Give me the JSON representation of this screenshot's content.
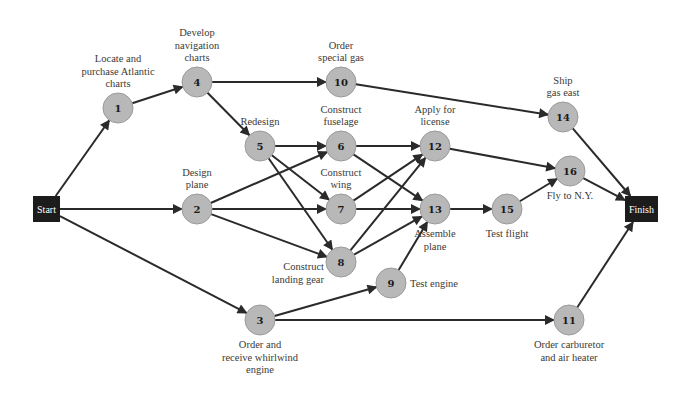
{
  "diagram": {
    "type": "network-diagram",
    "terminals": [
      {
        "id": "start",
        "label": "Start",
        "x": 33,
        "y": 196,
        "w": 27,
        "h": 26
      },
      {
        "id": "finish",
        "label": "Finish",
        "x": 625,
        "y": 196,
        "w": 33,
        "h": 26
      }
    ],
    "nodes": [
      {
        "id": "1",
        "number": "1",
        "x": 118,
        "y": 108,
        "label": [
          "Locate and",
          "purchase Atlantic",
          "charts"
        ],
        "label_pos": "above"
      },
      {
        "id": "2",
        "number": "2",
        "x": 197,
        "y": 209,
        "label": [
          "Design",
          "plane"
        ],
        "label_pos": "above"
      },
      {
        "id": "3",
        "number": "3",
        "x": 260,
        "y": 320,
        "label": [
          "Order and",
          "receive whirlwind",
          "engine"
        ],
        "label_pos": "below"
      },
      {
        "id": "4",
        "number": "4",
        "x": 197,
        "y": 82,
        "label": [
          "Develop",
          "navigation",
          "charts"
        ],
        "label_pos": "above"
      },
      {
        "id": "5",
        "number": "5",
        "x": 260,
        "y": 146,
        "label": [
          "Redesign"
        ],
        "label_pos": "above"
      },
      {
        "id": "6",
        "number": "6",
        "x": 341,
        "y": 146,
        "label": [
          "Construct",
          "fuselage"
        ],
        "label_pos": "above"
      },
      {
        "id": "7",
        "number": "7",
        "x": 341,
        "y": 209,
        "label": [
          "Construct",
          "wing"
        ],
        "label_pos": "above"
      },
      {
        "id": "8",
        "number": "8",
        "x": 341,
        "y": 262,
        "label": [
          "Construct",
          "landing gear"
        ],
        "label_pos": "left-below"
      },
      {
        "id": "9",
        "number": "9",
        "x": 391,
        "y": 283,
        "label": [
          "Test engine"
        ],
        "label_pos": "right"
      },
      {
        "id": "10",
        "number": "10",
        "x": 341,
        "y": 82,
        "label": [
          "Order",
          "special gas"
        ],
        "label_pos": "above"
      },
      {
        "id": "11",
        "number": "11",
        "x": 569,
        "y": 320,
        "label": [
          "Order carburetor",
          "and air heater"
        ],
        "label_pos": "below"
      },
      {
        "id": "12",
        "number": "12",
        "x": 435,
        "y": 146,
        "label": [
          "Apply for",
          "license"
        ],
        "label_pos": "above"
      },
      {
        "id": "13",
        "number": "13",
        "x": 435,
        "y": 209,
        "label": [
          "Assemble",
          "plane"
        ],
        "label_pos": "below"
      },
      {
        "id": "14",
        "number": "14",
        "x": 563,
        "y": 117,
        "label": [
          "Ship",
          "gas east"
        ],
        "label_pos": "above"
      },
      {
        "id": "15",
        "number": "15",
        "x": 507,
        "y": 209,
        "label": [
          "Test flight"
        ],
        "label_pos": "below"
      },
      {
        "id": "16",
        "number": "16",
        "x": 570,
        "y": 171,
        "label": [
          "Fly to N.Y."
        ],
        "label_pos": "below"
      }
    ],
    "edges": [
      [
        "start",
        "1"
      ],
      [
        "start",
        "2"
      ],
      [
        "start",
        "3"
      ],
      [
        "1",
        "4"
      ],
      [
        "4",
        "10"
      ],
      [
        "4",
        "5"
      ],
      [
        "10",
        "14"
      ],
      [
        "5",
        "6"
      ],
      [
        "5",
        "7"
      ],
      [
        "5",
        "8"
      ],
      [
        "2",
        "6"
      ],
      [
        "2",
        "7"
      ],
      [
        "2",
        "8"
      ],
      [
        "6",
        "12"
      ],
      [
        "6",
        "13"
      ],
      [
        "7",
        "12"
      ],
      [
        "7",
        "13"
      ],
      [
        "8",
        "12"
      ],
      [
        "8",
        "13"
      ],
      [
        "3",
        "9"
      ],
      [
        "3",
        "11"
      ],
      [
        "9",
        "13"
      ],
      [
        "12",
        "16"
      ],
      [
        "13",
        "15"
      ],
      [
        "15",
        "16"
      ],
      [
        "14",
        "finish"
      ],
      [
        "16",
        "finish"
      ],
      [
        "11",
        "finish"
      ]
    ],
    "colors": {
      "node_fill": "#b8b8b8",
      "terminal_fill": "#1c1c1c",
      "edge": "#2a2a2a",
      "label_text": "#3a3a3a"
    }
  }
}
